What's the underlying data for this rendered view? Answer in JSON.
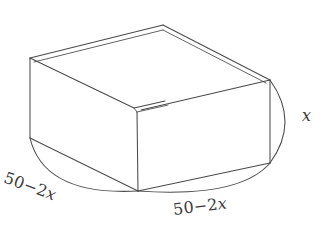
{
  "figure": {
    "background_color": "#ffffff",
    "line_color": "#4a4a4a",
    "label_color": "#3b3b3b",
    "labels": {
      "left_side": {
        "full": "50 − 2x",
        "number": "50",
        "minus": "−",
        "coefficient": "2",
        "variable": "x"
      },
      "right_side": {
        "full": "50 − 2x",
        "number": "50",
        "minus": "−",
        "coefficient": "2",
        "variable": "x"
      },
      "height": {
        "full": "x",
        "variable": "x"
      }
    }
  }
}
